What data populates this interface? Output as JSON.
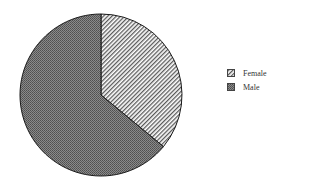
{
  "chart_data": {
    "type": "pie",
    "title": "",
    "categories": [
      "Female",
      "Male"
    ],
    "values": [
      36,
      64
    ],
    "start_angle_deg": 0,
    "direction": "clockwise",
    "fills": {
      "Female": "diagonal-hatch",
      "Male": "dark-stipple"
    },
    "legend_position": "right"
  },
  "legend": {
    "items": [
      {
        "label": "Female",
        "fill": "diagonal-hatch"
      },
      {
        "label": "Male",
        "fill": "dark-stipple"
      }
    ]
  },
  "colors": {
    "outline": "#1a1a1a",
    "male_fill": "#6f6f6f",
    "female_bg": "#ffffff",
    "hatch": "#555555"
  }
}
